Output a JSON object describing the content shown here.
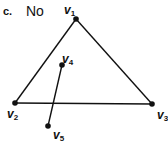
{
  "header": {
    "part_label": "c.",
    "answer": "No"
  },
  "graph": {
    "edge_color": "#111111",
    "vertices": [
      {
        "id": "v1",
        "name": "v",
        "sub": "1",
        "x": 76,
        "y": 19
      },
      {
        "id": "v2",
        "name": "v",
        "sub": "2",
        "x": 15,
        "y": 103
      },
      {
        "id": "v3",
        "name": "v",
        "sub": "3",
        "x": 152,
        "y": 104
      },
      {
        "id": "v4",
        "name": "v",
        "sub": "4",
        "x": 62,
        "y": 65
      },
      {
        "id": "v5",
        "name": "v",
        "sub": "5",
        "x": 48,
        "y": 126
      }
    ],
    "edges": [
      [
        "v1",
        "v2"
      ],
      [
        "v1",
        "v3"
      ],
      [
        "v2",
        "v3"
      ],
      [
        "v4",
        "v5"
      ]
    ]
  }
}
